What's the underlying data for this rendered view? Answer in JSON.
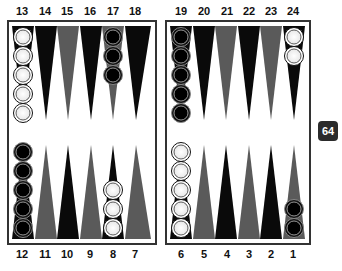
{
  "board": {
    "top_labels": [
      "13",
      "14",
      "15",
      "16",
      "17",
      "18",
      "19",
      "20",
      "21",
      "22",
      "23",
      "24"
    ],
    "bottom_labels": [
      "12",
      "11",
      "10",
      "9",
      "8",
      "7",
      "6",
      "5",
      "4",
      "3",
      "2",
      "1"
    ],
    "colors": {
      "dark_point": "#0a0a0a",
      "gray_point": "#5a5a5a",
      "frame": "#333333"
    },
    "points": [
      {
        "point": 13,
        "checker": "white",
        "count": 5
      },
      {
        "point": 17,
        "checker": "black",
        "count": 3
      },
      {
        "point": 19,
        "checker": "black",
        "count": 5
      },
      {
        "point": 24,
        "checker": "white",
        "count": 2
      },
      {
        "point": 12,
        "checker": "black",
        "count": 5
      },
      {
        "point": 8,
        "checker": "white",
        "count": 3
      },
      {
        "point": 6,
        "checker": "white",
        "count": 5
      },
      {
        "point": 1,
        "checker": "black",
        "count": 2
      }
    ]
  },
  "cube": {
    "value": "64"
  }
}
